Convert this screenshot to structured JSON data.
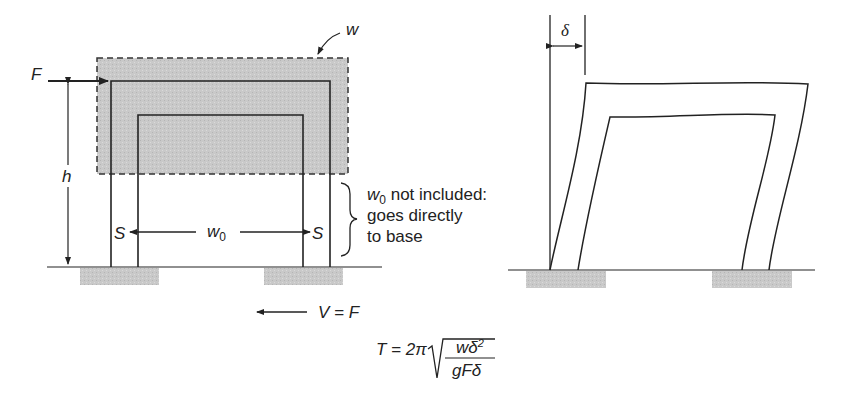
{
  "left_diagram": {
    "force_label": "F",
    "weight_label": "w",
    "height_label": "h",
    "support_left": "S",
    "support_right": "S",
    "base_weight_label": "w",
    "base_weight_sub": "0",
    "note_line1_var": "w",
    "note_line1_sub": "0",
    "note_line1_text": " not included:",
    "note_line2": "goes directly",
    "note_line3": "to base",
    "shear_label": "V = F"
  },
  "right_diagram": {
    "drift_label": "δ"
  },
  "formula": {
    "lhs": "T = 2π",
    "numerator_var": "wδ",
    "numerator_exp": "2",
    "denominator": "gFδ"
  },
  "colors": {
    "line": "#222222",
    "shade": "#c8c8c8",
    "footing": "#cfcfcf"
  }
}
